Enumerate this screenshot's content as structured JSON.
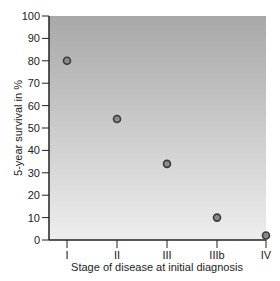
{
  "chart_data": {
    "type": "scatter",
    "title": "",
    "xlabel": "Stage of disease at initial diagnosis",
    "ylabel": "5-year survival in %",
    "categories": [
      "I",
      "II",
      "III",
      "IIIb",
      "IV"
    ],
    "values": [
      80,
      54,
      34,
      10,
      2
    ],
    "series": [
      {
        "name": "5-year survival",
        "x": [
          "I",
          "II",
          "III",
          "IIIb",
          "IV"
        ],
        "values": [
          80,
          54,
          34,
          10,
          2
        ]
      }
    ],
    "ylim": [
      0,
      100
    ],
    "yticks": [
      0,
      10,
      20,
      30,
      40,
      50,
      60,
      70,
      80,
      90,
      100
    ],
    "grid": false,
    "legend": null,
    "background": "gradient gray (darker at top, lighter at bottom)"
  },
  "colors": {
    "plot_top": "#a9a9a9",
    "plot_bottom": "#ececec",
    "marker_fill": "#8a8a8a",
    "marker_stroke": "#3a3a3a",
    "axis": "#222222"
  }
}
